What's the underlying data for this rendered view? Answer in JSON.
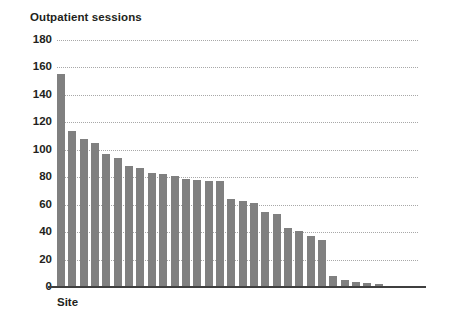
{
  "chart_data": {
    "type": "bar",
    "title": "Outpatient sessions",
    "xlabel": "Site",
    "ylabel": "",
    "ylim": [
      0,
      180
    ],
    "ytick_step": 20,
    "yticks": [
      180,
      160,
      140,
      120,
      100,
      80,
      60,
      40,
      20,
      0
    ],
    "ytick_labels": [
      "180",
      "160",
      "140",
      "120",
      "100",
      "80",
      "60",
      "40",
      "20",
      "0"
    ],
    "grid": true,
    "grid_axis": "y",
    "grid_style": "dotted",
    "legend": "none",
    "bar_color": "#808080",
    "axis_color": "#3f3f3f",
    "grid_color": "#9a9a9a",
    "text_color": "#231f20",
    "background": "#ffffff",
    "categories": [
      "Site 1",
      "Site 2",
      "Site 3",
      "Site 4",
      "Site 5",
      "Site 6",
      "Site 7",
      "Site 8",
      "Site 9",
      "Site 10",
      "Site 11",
      "Site 12",
      "Site 13",
      "Site 14",
      "Site 15",
      "Site 16",
      "Site 17",
      "Site 18",
      "Site 19",
      "Site 20",
      "Site 21",
      "Site 22",
      "Site 23",
      "Site 24",
      "Site 25",
      "Site 26",
      "Site 27",
      "Site 28",
      "Site 29",
      "Site 30",
      "Site 31"
    ],
    "values": [
      155,
      114,
      108,
      105,
      97,
      94,
      88,
      87,
      83,
      82,
      81,
      79,
      78,
      77,
      77,
      64,
      63,
      61,
      55,
      53,
      43,
      41,
      37,
      34,
      8,
      5,
      4,
      3,
      2,
      1,
      0
    ]
  }
}
